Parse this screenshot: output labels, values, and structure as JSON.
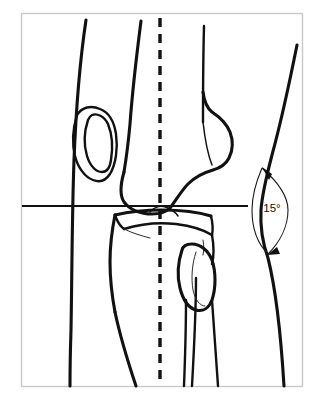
{
  "figure": {
    "background_color": "#ffffff",
    "frame": {
      "border_color": "#c9c9c9",
      "x": 21,
      "y": 13,
      "width": 281,
      "height": 373
    }
  },
  "annotations": {
    "angle": {
      "label": "15°",
      "value": 15,
      "unit": "degrees",
      "label_x": 272,
      "label_y": 209,
      "color": "#111111"
    }
  },
  "reference_lines": {
    "vertical_axis": {
      "name": "mechanical-axis",
      "style": "dashed",
      "x": 160,
      "y_start": 18,
      "y_end": 386,
      "color": "#111111"
    },
    "horizontal_axis": {
      "name": "joint-line",
      "style": "solid",
      "y": 206,
      "x_start": 22,
      "x_end": 248,
      "color": "#111111"
    }
  },
  "anatomy": {
    "parts": [
      {
        "name": "femur-shaft",
        "label": "Femoral shaft"
      },
      {
        "name": "femoral-condyles",
        "label": "Femoral condyles"
      },
      {
        "name": "patella",
        "label": "Patella"
      },
      {
        "name": "tibial-plateau",
        "label": "Tibial plateau"
      },
      {
        "name": "tibia-shaft",
        "label": "Tibial shaft"
      },
      {
        "name": "fibular-head",
        "label": "Fibular head"
      },
      {
        "name": "fibula-shaft",
        "label": "Fibular shaft"
      },
      {
        "name": "skin-contour-medial",
        "label": "Medial skin contour"
      },
      {
        "name": "skin-contour-lateral",
        "label": "Lateral skin contour"
      }
    ]
  },
  "paths": {
    "skin_medial": "M 86,20 C 80,60 76,110 74,160 C 72,215 72,275 71,330 C 70,360 70,375 70,386",
    "skin_lateral": "M 297,45 C 289,85 281,122 272,155 C 266,178 262,196 261,210 C 260,228 263,244 268,258 C 274,282 280,320 284,386",
    "femur_shaft_left": "M 141,21 C 136,60 132,96 130,124 C 128,146 126,160 124,172",
    "femur_shaft_right": "M 204,26 C 203,64 203,98 203,122",
    "femur_condyle_outline": "M 124,172 C 120,186 120,196 124,202 C 130,210 141,214 152,214 C 160,214 166,212 170,208 C 176,200 182,190 188,184 C 196,176 206,172 213,170 C 220,168 226,164 229,158 C 233,150 233,140 230,132 C 226,122 218,116 212,112 C 207,108 204,100 203,92",
    "femur_condyle_inner": "M 203,122 C 205,140 208,155 212,165",
    "patella_outer": "M 77,115 C 73,128 72,144 75,156 C 78,168 85,177 93,180 C 100,183 106,180 110,174 C 116,164 118,148 116,134 C 114,121 108,112 100,109 C 91,105 82,107 77,115 Z",
    "patella_inner": "M 88,120 C 84,132 84,146 87,156 C 90,166 96,172 102,172 C 107,172 110,167 111,160 C 113,148 112,134 108,124 C 104,116 97,113 92,115 C 90,116 89,118 88,120 Z",
    "tibia_plateau_top": "M 115,215 C 128,212 146,210 162,210 C 180,210 198,212 211,216",
    "tibia_plateau_left_rim": "M 115,215 C 117,221 120,226 124,229",
    "tibia_plateau_curve": "M 124,229 C 140,224 158,222 176,224 C 192,226 204,230 212,235",
    "tibia_plateau_right_rim": "M 211,216 C 213,224 213,230 212,235",
    "tibia_spine": "M 150,212 C 155,206 162,205 168,208 C 173,210 176,213 178,216",
    "tibia_body_left": "M 115,215 C 112,230 110,248 110,262 C 110,278 112,296 115,312",
    "tibia_body_right": "M 212,235 C 214,246 214,256 212,264",
    "tibia_shaft_left": "M 115,312 C 120,336 128,362 136,386",
    "tibia_shaft_right": "M 196,278 C 196,310 194,350 192,386",
    "tibia_hairline_a": "M 124,229 C 132,233 142,236 150,238",
    "tibia_hairline_b": "M 203,240 C 204,246 204,251 203,255",
    "fibula_head_outer": "M 182,250 C 178,262 177,276 180,288 C 183,300 189,308 196,310 C 203,312 209,308 212,300 C 216,288 216,272 212,260 C 208,250 200,244 192,244 C 187,244 183,246 182,250 Z",
    "fibula_head_inner": "M 196,252 C 192,264 191,278 193,290 C 195,300 200,306 205,306",
    "fibula_shaft_left": "M 186,300 C 186,330 185,360 184,386",
    "fibula_shaft_right": "M 212,300 C 214,330 216,360 218,386",
    "angle_arc_outer": "M 262,168 C 278,182 288,196 288,210 C 288,226 280,242 268,254",
    "angle_arc_inner": "M 262,168 C 256,182 252,196 252,210 C 252,228 258,244 268,254"
  },
  "arrows": {
    "top": {
      "name": "angle-arrow-top",
      "tip_x": 263,
      "tip_y": 168
    },
    "bottom": {
      "name": "angle-arrow-bottom",
      "tip_x": 268,
      "tip_y": 254
    }
  }
}
